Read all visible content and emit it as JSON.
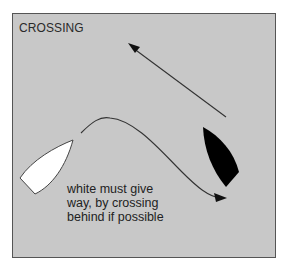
{
  "diagram": {
    "title": "CROSSING",
    "caption_lines": [
      "white must give",
      "way, by crossing",
      "behind if possible"
    ],
    "colors": {
      "background": "#c8c8c8",
      "border": "#555555",
      "white_boat": "#ffffff",
      "black_boat": "#000000",
      "arrow": "#333333"
    },
    "elements": {
      "white_boat": "white boat on port side heading up-right",
      "black_boat": "black boat heading up-left",
      "straight_arrow": "black boat course",
      "curved_arrow": "white boat course crossing behind"
    }
  }
}
